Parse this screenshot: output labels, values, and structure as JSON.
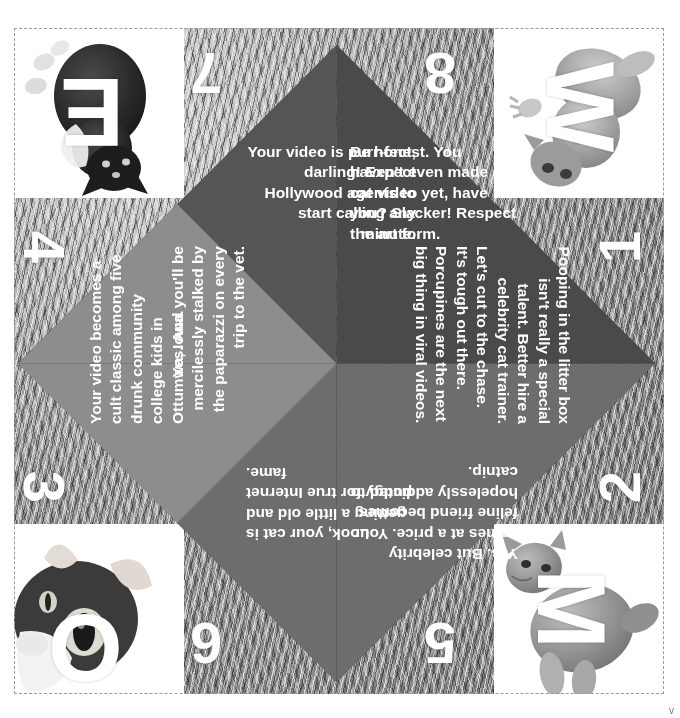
{
  "page": {
    "background_subject": "cat-fur-texture",
    "colors": {
      "flap_dark": "#4a4a4a",
      "flap_mid_dark": "#555555",
      "flap_mid": "#6d6d6d",
      "flap_light": "#8d8d8d",
      "text": "#ffffff",
      "fur": "#8e8e8e",
      "cut_line": "#9a9a9a"
    }
  },
  "corner_photos": [
    {
      "position": "top-left",
      "letter": "E",
      "rotation_deg": 180,
      "subject": "tuxedo-kitten-photo"
    },
    {
      "position": "top-right",
      "letter": "W",
      "rotation_deg": 90,
      "subject": "tabby-kitten-photo"
    },
    {
      "position": "bottom-left",
      "letter": "O",
      "rotation_deg": 0,
      "subject": "kitten-face-photo"
    },
    {
      "position": "bottom-right",
      "letter": "M",
      "rotation_deg": 90,
      "subject": "sitting-kitten-photo"
    }
  ],
  "fold_numbers": [
    {
      "id": "7",
      "label": "7",
      "rotation_deg": 180
    },
    {
      "id": "8",
      "label": "8",
      "rotation_deg": 180
    },
    {
      "id": "4",
      "label": "4",
      "rotation_deg": 90
    },
    {
      "id": "1",
      "label": "1",
      "rotation_deg": 270
    },
    {
      "id": "3",
      "label": "3",
      "rotation_deg": 90
    },
    {
      "id": "2",
      "label": "2",
      "rotation_deg": 270
    },
    {
      "id": "6",
      "label": "6",
      "rotation_deg": 180
    },
    {
      "id": "5",
      "label": "5",
      "rotation_deg": 180
    }
  ],
  "fortunes": [
    {
      "number": "7",
      "text": "Your video is purr-fect, darling! Expect Hollywood agents to start calling any minute.",
      "shade": "#555555"
    },
    {
      "number": "8",
      "text": "Be honest. You haven't even made a cat video yet, have you? Slacker! Respect the art form.",
      "shade": "#4a4a4a"
    },
    {
      "number": "4",
      "text": "Your video becomes a cult classic among five drunk community college kids in Ottumwa, Iowa.",
      "shade": "#8d8d8d"
    },
    {
      "number": "3",
      "text": "Yes. And you'll be mercilessly stalked by the paparazzi on every trip to the vet.",
      "shade": "#8d8d8d"
    },
    {
      "number": "1",
      "text": "Pooping in the litter box isn't really a special talent. Better hire a celebrity cat trainer.",
      "shade": "#4a4a4a"
    },
    {
      "number": "2",
      "text": "Let's cut to the chase. It's tough out there. Porcupines are the next big thing in viral videos.",
      "shade": "#555555"
    },
    {
      "number": "6",
      "text": "Look, your cat is getting a little old and pudgy for true Internet fame.",
      "shade": "#6d6d6d"
    },
    {
      "number": "5",
      "text": "Yes. But celebrity comes at a price. Your feline friend becomes hopelessly addicted to catnip.",
      "shade": "#6d6d6d"
    }
  ],
  "corner_mark": "v"
}
